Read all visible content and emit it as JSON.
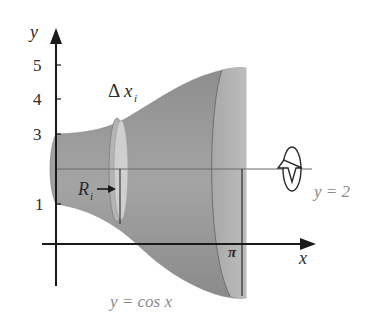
{
  "figure": {
    "axes": {
      "y_label": "y",
      "x_label": "x",
      "y_ticks": [
        {
          "label": "5",
          "value": 5
        },
        {
          "label": "4",
          "value": 4
        },
        {
          "label": "3",
          "value": 3
        },
        {
          "label": "1",
          "value": 1
        }
      ],
      "x_ticks": [
        {
          "label": "π",
          "value": 3.14159
        }
      ]
    },
    "labels": {
      "delta_x": "Δ",
      "delta_x_var": "x",
      "delta_x_sub": "i",
      "radius": "R",
      "radius_sub": "i",
      "axis_of_rotation": "y = 2",
      "curve": "y = cos x",
      "pi": "π"
    },
    "colors": {
      "solid_fill": "#9c9c9c",
      "solid_dark": "#7e7e7e",
      "disk_fill": "#c9c9c9",
      "axis": "#1a1a1a",
      "label_gray": "#8a8a8a"
    }
  }
}
